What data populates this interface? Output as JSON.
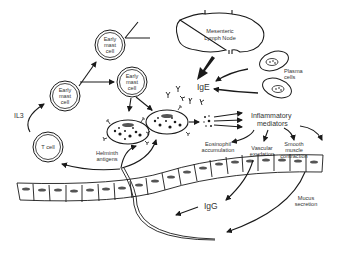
{
  "diagram": {
    "colors": {
      "ink": "#1a1a1a",
      "text": "#333333",
      "background": "#ffffff",
      "nucleus": "#555555"
    },
    "labels": {
      "lymph_node": [
        "Mesenteric",
        "Lymph Node"
      ],
      "plasma_cells": [
        "Plasma",
        "cells"
      ],
      "ige": "IgE",
      "igg": "IgG",
      "il3": "IL3",
      "t_cell": "T cell",
      "early_mast_cell": [
        "Early",
        "mast",
        "cell"
      ],
      "helminth_antigens": [
        "Helminth",
        "antigens"
      ],
      "inflammatory_mediators": [
        "Inflammatory",
        "mediators"
      ],
      "eosinophil": [
        "Eosinophil",
        "accumulation"
      ],
      "vascular": [
        "Vascular",
        "exudation"
      ],
      "smooth_muscle": [
        "Smooth",
        "muscle",
        "contraction"
      ],
      "mucus": [
        "Mucus",
        "secretion"
      ]
    }
  }
}
